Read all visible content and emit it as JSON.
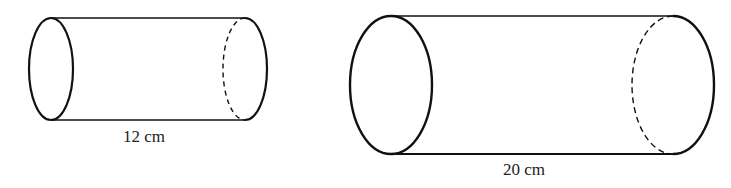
{
  "diagram": {
    "type": "cylinders",
    "stroke_color": "#111111",
    "cylinders": [
      {
        "id": "small",
        "length_label": "12 cm",
        "length_value": 12,
        "unit": "cm"
      },
      {
        "id": "large",
        "length_label": "20 cm",
        "length_value": 20,
        "unit": "cm"
      }
    ]
  }
}
